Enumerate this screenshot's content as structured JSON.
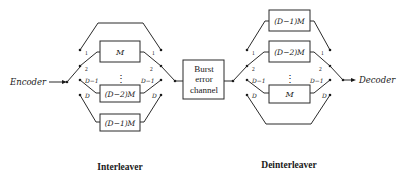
{
  "diagram": {
    "type": "convolutional interleaver / deinterleaver",
    "input_label": "Encoder",
    "output_label": "Decoder",
    "channel_label_lines": [
      "Burst",
      "error",
      "channel"
    ],
    "interleaver": {
      "caption": "Interleaver",
      "switch_positions": [
        "1",
        "2",
        "D−1",
        "D"
      ],
      "branches": [
        {
          "position": "1",
          "delay": ""
        },
        {
          "position": "2",
          "delay": "M"
        },
        {
          "position": "D−1",
          "delay": "(D−2)M"
        },
        {
          "position": "D",
          "delay": "(D−1)M"
        }
      ],
      "ellipsis": "⋮"
    },
    "deinterleaver": {
      "caption": "Deinterleaver",
      "switch_positions": [
        "1",
        "2",
        "D−1",
        "D"
      ],
      "branches": [
        {
          "position": "1",
          "delay": "(D−1)M"
        },
        {
          "position": "2",
          "delay": "(D−2)M"
        },
        {
          "position": "D−1",
          "delay": "M"
        },
        {
          "position": "D",
          "delay": ""
        }
      ],
      "ellipsis": "⋮"
    }
  }
}
